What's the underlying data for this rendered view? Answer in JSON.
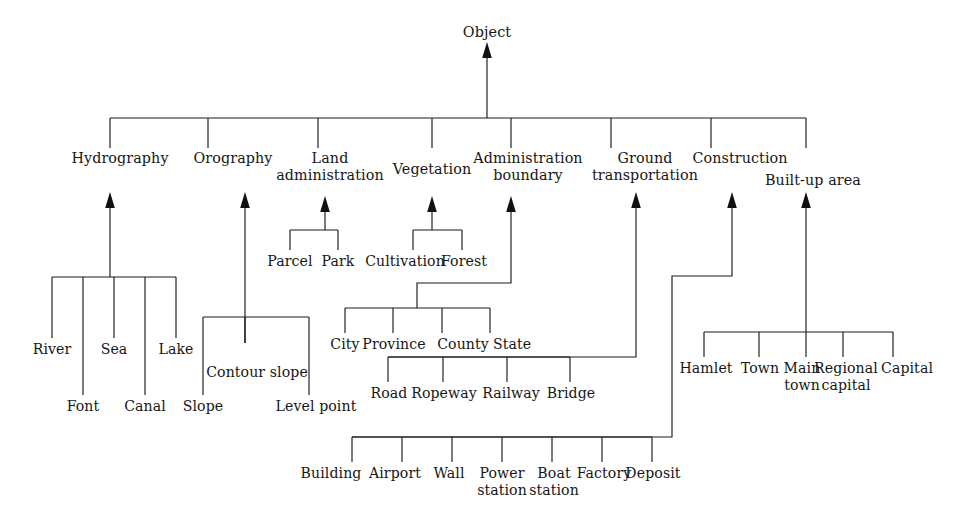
{
  "diagram": {
    "title": "Object",
    "type": "hierarchy-tree",
    "root": {
      "label": "Object"
    },
    "level2": [
      {
        "label": "Hydrography"
      },
      {
        "label": "Orography"
      },
      {
        "label": "Land\nadministration"
      },
      {
        "label": "Vegetation"
      },
      {
        "label": "Administration\nboundary"
      },
      {
        "label": "Ground\ntransportation"
      },
      {
        "label": "Construction"
      },
      {
        "label": "Built-up area"
      }
    ],
    "leaves": {
      "hydrography": [
        {
          "label": "River"
        },
        {
          "label": "Font"
        },
        {
          "label": "Sea"
        },
        {
          "label": "Canal"
        },
        {
          "label": "Lake"
        }
      ],
      "orography": [
        {
          "label": "Slope"
        },
        {
          "label": "Contour slope"
        },
        {
          "label": "Level point"
        }
      ],
      "land_administration": [
        {
          "label": "Parcel"
        },
        {
          "label": "Park"
        }
      ],
      "vegetation": [
        {
          "label": "Cultivation"
        },
        {
          "label": "Forest"
        }
      ],
      "administration_boundary": [
        {
          "label": "City"
        },
        {
          "label": "Province"
        },
        {
          "label": "County"
        },
        {
          "label": "State"
        }
      ],
      "ground_transportation": [
        {
          "label": "Road"
        },
        {
          "label": "Ropeway"
        },
        {
          "label": "Railway"
        },
        {
          "label": "Bridge"
        }
      ],
      "construction": [
        {
          "label": "Building"
        },
        {
          "label": "Airport"
        },
        {
          "label": "Wall"
        },
        {
          "label": "Power\nstation"
        },
        {
          "label": "Boat\nstation"
        },
        {
          "label": "Factory"
        },
        {
          "label": "Deposit"
        }
      ],
      "built_up_area": [
        {
          "label": "Hamlet"
        },
        {
          "label": "Town"
        },
        {
          "label": "Main\ntown"
        },
        {
          "label": "Regional\ncapital"
        },
        {
          "label": "Capital"
        }
      ]
    },
    "colors": {
      "line": "#1a1a1a",
      "text": "#161616",
      "background": "#ffffff"
    }
  }
}
